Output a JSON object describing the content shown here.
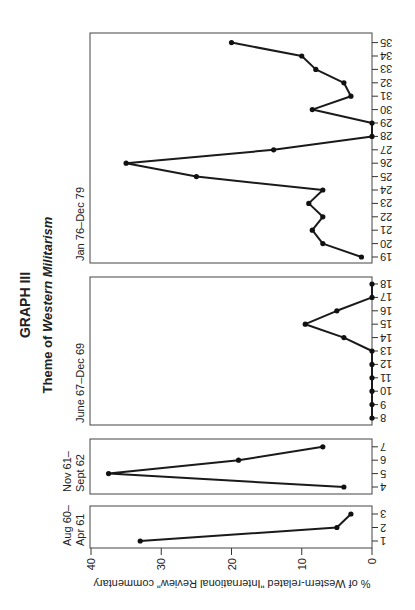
{
  "chart_data": {
    "type": "line",
    "title": "GRAPH III",
    "subtitle_prefix": "Theme of ",
    "subtitle_emph": "Western Militarism",
    "ylabel": "% of Western-related \"International Review\" commentary",
    "xlabel": "",
    "ylim": [
      0,
      40
    ],
    "yticks": [
      0,
      10,
      20,
      30,
      40
    ],
    "grid": false,
    "orientation": "rotated 90 degrees counter-clockwise",
    "panels": [
      {
        "period_lines": [
          "Aug 60–",
          "Apr 61"
        ],
        "x": [
          1,
          2,
          3
        ],
        "values": [
          33,
          5,
          3
        ]
      },
      {
        "period_lines": [
          "Nov 61–",
          "Sept 62"
        ],
        "x": [
          4,
          5,
          6,
          7
        ],
        "values": [
          4,
          37.5,
          19,
          7
        ]
      },
      {
        "period_lines": [
          "June 67–Dec 69"
        ],
        "x": [
          8,
          9,
          10,
          11,
          12,
          13,
          14,
          15,
          16,
          17,
          18
        ],
        "values": [
          0,
          0,
          0,
          0,
          0,
          0,
          4,
          9.5,
          5,
          0,
          0
        ]
      },
      {
        "period_lines": [
          "Jan 76–Dec 79"
        ],
        "x": [
          19,
          20,
          21,
          22,
          23,
          24,
          25,
          26,
          27,
          28,
          29,
          30,
          31,
          32,
          33,
          34,
          35
        ],
        "values": [
          1.5,
          7,
          8.5,
          7,
          9,
          7,
          25,
          35,
          14,
          0,
          0,
          8.5,
          3,
          4,
          8,
          10,
          20
        ]
      }
    ]
  }
}
